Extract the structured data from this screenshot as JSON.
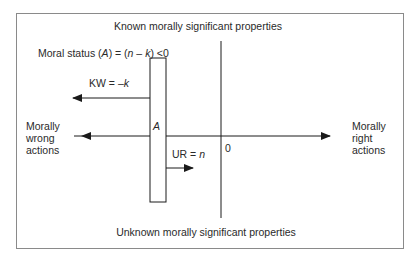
{
  "diagram": {
    "title_top": "Known morally significant properties",
    "title_bottom": "Unknown morally significant properties",
    "moral_status": {
      "prefix": "Moral status (",
      "var_a": "A",
      "middle": ") = (",
      "var_n": "n",
      "minus": " – ",
      "var_k": "k",
      "suffix": ") <0"
    },
    "kw_label": {
      "prefix": "KW = –",
      "var": "k"
    },
    "ur_label": {
      "prefix": "UR = ",
      "var": "n"
    },
    "bar_label": "A",
    "origin_label": "0",
    "left_label": [
      "Morally",
      "wrong",
      "actions"
    ],
    "right_label": [
      "Morally",
      "right",
      "actions"
    ],
    "colors": {
      "line": "#1a1a1a",
      "frame": "#8a8a8a",
      "text": "#2a2a2a"
    }
  }
}
